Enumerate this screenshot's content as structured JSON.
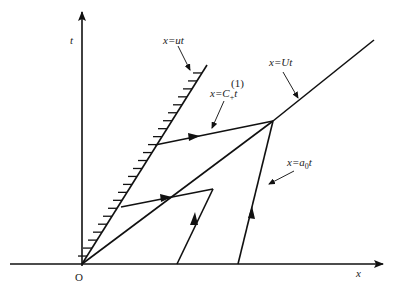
{
  "diagram": {
    "type": "x-t wave diagram (piston-driven shock)",
    "axes": {
      "x_label": "x",
      "t_label": "t",
      "origin_label": "O"
    },
    "labels": {
      "piston": "x=ut",
      "characteristic_prefix": "x=C",
      "characteristic_sub": "+",
      "characteristic_sup": "(1)",
      "characteristic_suffix": "t",
      "shock": "x=Ut",
      "sound_prefix": "x=a",
      "sound_sub": "0",
      "sound_suffix": "t"
    },
    "elements": [
      "piston path x=ut (hatched wall)",
      "shock path x=Ut",
      "characteristic line x=C+(1) t",
      "sound characteristic x=a0 t",
      "reflected characteristics with arrows"
    ]
  }
}
